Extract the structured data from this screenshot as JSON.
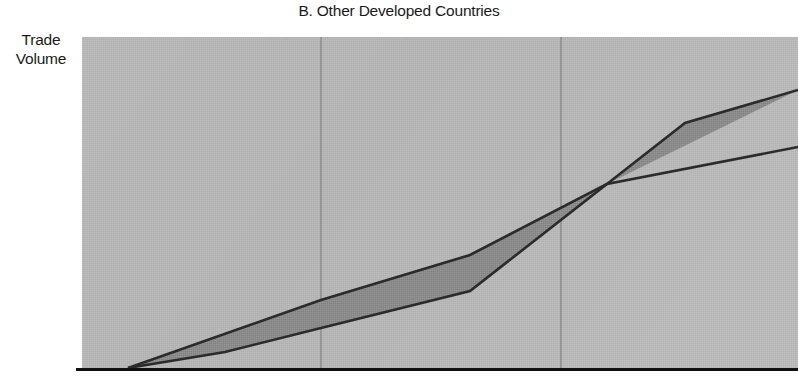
{
  "chart_data": {
    "type": "area",
    "title": "B. Other Developed Countries",
    "xlabel": "",
    "ylabel": "Trade Volume",
    "ylabel_lines": [
      "Trade",
      "Volume"
    ],
    "grid": true,
    "grid_orientation": "vertical",
    "gridlines_x": [
      321,
      561
    ],
    "legend": "none",
    "axis_ticks": [],
    "xlim": [
      82,
      798
    ],
    "ylim": [
      37,
      369
    ],
    "plot_area": {
      "left": 82,
      "top": 37,
      "right": 798,
      "bottom": 369
    },
    "colors": {
      "plot_background": "#b5b5b5",
      "band_fill": "#8a8a8a",
      "line": "#2b2b2b",
      "gridline": "#8f8f8f",
      "axis": "#111111",
      "text": "#1a1a1a",
      "page_background": "#ffffff"
    },
    "series": [
      {
        "name": "upper-boundary",
        "points": [
          [
            128,
            368
          ],
          [
            321,
            300
          ],
          [
            470,
            255
          ],
          [
            607,
            184
          ],
          [
            685,
            123
          ],
          [
            798,
            90
          ]
        ]
      },
      {
        "name": "lower-boundary",
        "points": [
          [
            128,
            368
          ],
          [
            225,
            352
          ],
          [
            321,
            328
          ],
          [
            470,
            291
          ],
          [
            607,
            184
          ],
          [
            798,
            147
          ]
        ]
      }
    ],
    "band": {
      "name": "between-lines-shaded-region",
      "crossing_point": [
        607,
        184
      ]
    },
    "annotations": []
  }
}
